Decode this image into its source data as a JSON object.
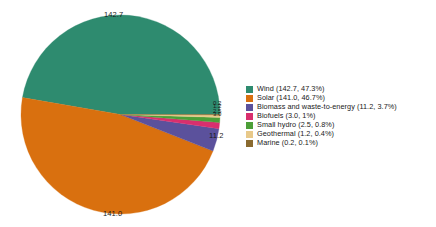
{
  "chart_data": {
    "type": "pie",
    "title": "",
    "subtitle": "",
    "xlabel": "",
    "ylabel": "",
    "grid": false,
    "legend_position": "right",
    "start_angle_deg": 0,
    "direction": "counterclockwise",
    "total": 301.8,
    "categories": [
      "Wind",
      "Solar",
      "Biomass and waste-to-energy",
      "Biofuels",
      "Small hydro",
      "Geothermal",
      "Marine"
    ],
    "values": [
      142.7,
      141.0,
      11.2,
      3.0,
      2.5,
      1.2,
      0.2
    ],
    "percents": [
      47.3,
      46.7,
      3.7,
      1.0,
      0.8,
      0.4,
      0.1
    ],
    "colors": [
      "#2e8b6f",
      "#d9700f",
      "#5b519c",
      "#d92f6e",
      "#4c9f38",
      "#e8c98a",
      "#8a6a2f"
    ],
    "slices": [
      {
        "label": "Wind",
        "value": 142.7,
        "percent": 47.3,
        "color": "#2e8b6f",
        "value_label": "142.7",
        "legend_label": "Wind (142.7, 47.3%)"
      },
      {
        "label": "Solar",
        "value": 141.0,
        "percent": 46.7,
        "color": "#d9700f",
        "value_label": "141.0",
        "legend_label": "Solar (141.0, 46.7%)"
      },
      {
        "label": "Biomass and waste-to-energy",
        "value": 11.2,
        "percent": 3.7,
        "color": "#5b519c",
        "value_label": "11.2",
        "legend_label": "Biomass and waste-to-energy (11.2, 3.7%)"
      },
      {
        "label": "Biofuels",
        "value": 3.0,
        "percent": 1.0,
        "color": "#d92f6e",
        "value_label": "3.0",
        "legend_label": "Biofuels (3.0, 1%)"
      },
      {
        "label": "Small hydro",
        "value": 2.5,
        "percent": 0.8,
        "color": "#4c9f38",
        "value_label": "2.5",
        "legend_label": "Small hydro (2.5, 0.8%)"
      },
      {
        "label": "Geothermal",
        "value": 1.2,
        "percent": 0.4,
        "color": "#e8c98a",
        "value_label": "1.2",
        "legend_label": "Geothermal (1.2, 0.4%)"
      },
      {
        "label": "Marine",
        "value": 0.2,
        "percent": 0.1,
        "color": "#8a6a2f",
        "value_label": "0.2",
        "legend_label": "Marine (0.2, 0.1%)"
      }
    ]
  },
  "legend": {
    "items": [
      {
        "label": "Wind (142.7, 47.3%)",
        "color": "#2e8b6f"
      },
      {
        "label": "Solar (141.0, 46.7%)",
        "color": "#d9700f"
      },
      {
        "label": "Biomass and waste-to-energy (11.2, 3.7%)",
        "color": "#5b519c"
      },
      {
        "label": "Biofuels (3.0, 1%)",
        "color": "#d92f6e"
      },
      {
        "label": "Small hydro (2.5, 0.8%)",
        "color": "#4c9f38"
      },
      {
        "label": "Geothermal (1.2, 0.4%)",
        "color": "#e8c98a"
      },
      {
        "label": "Marine (0.2, 0.1%)",
        "color": "#8a6a2f"
      }
    ]
  },
  "pie_labels": {
    "wind": "142.7",
    "solar": "141.0",
    "biomass": "11.2",
    "biofuels": "3.0",
    "small_hydro": "2.5",
    "geothermal": "1.2",
    "marine": "0.2"
  },
  "background_color": "#ffffff",
  "text_color": "#1a1a1a"
}
